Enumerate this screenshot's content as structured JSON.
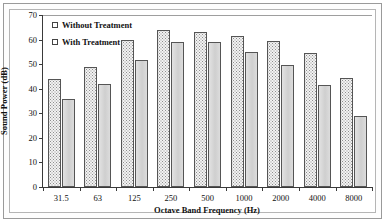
{
  "chart_data": {
    "type": "bar",
    "title": "",
    "xlabel": "Octave Band Frequency (Hz)",
    "ylabel": "Sound Power (dB)",
    "categories": [
      "31.5",
      "63",
      "125",
      "250",
      "500",
      "1000",
      "2000",
      "4000",
      "8000"
    ],
    "series": [
      {
        "name": "Without Treatment",
        "values": [
          44,
          49,
          60,
          64,
          63,
          61.5,
          59.5,
          54.5,
          44.5
        ]
      },
      {
        "name": "With Treatment",
        "values": [
          36,
          42,
          51.5,
          59,
          59,
          55,
          49.5,
          41.5,
          29
        ]
      }
    ],
    "ylim": [
      0,
      70
    ],
    "yticks": [
      0,
      10,
      20,
      30,
      40,
      50,
      60,
      70
    ],
    "ytick_labels": [
      "0",
      "10",
      "20",
      "30",
      "40",
      "50",
      "60",
      "70"
    ],
    "grid": "top-only",
    "legend_position": "inside-top-left",
    "colors": {
      "series_without_treatment": "#f2f2f2",
      "series_with_treatment": "#d9d9d9",
      "bar_outline": "#555555",
      "axis": "#3a3a3a",
      "gridline": "#9e9e9e",
      "text": "#111111",
      "frame": "#9a9a9a",
      "background": "#ffffff"
    }
  }
}
